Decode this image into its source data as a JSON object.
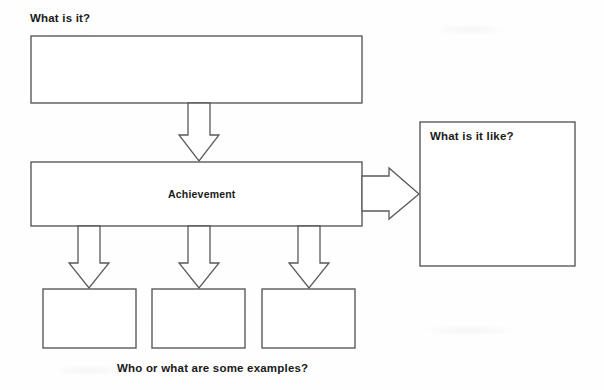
{
  "diagram": {
    "type": "concept-definition-map",
    "title_label": "What is it?",
    "concept_label": "Achievement",
    "like_label": "What is it like?",
    "examples_caption": "Who or what are some examples?",
    "stroke_color": "#5a5a5a",
    "fill_color": "#ffffff",
    "text_color": "#1a1a1a",
    "boxes": {
      "definition_box": {
        "label": "",
        "x": 31,
        "y": 36,
        "w": 331,
        "h": 67
      },
      "concept_box": {
        "label": "Achievement",
        "x": 31,
        "y": 162,
        "w": 331,
        "h": 64
      },
      "like_box": {
        "label": "",
        "x": 420,
        "y": 122,
        "w": 155,
        "h": 144
      },
      "example_box_1": {
        "label": "",
        "x": 43,
        "y": 289,
        "w": 93,
        "h": 59
      },
      "example_box_2": {
        "label": "",
        "x": 152,
        "y": 289,
        "w": 93,
        "h": 59
      },
      "example_box_3": {
        "label": "",
        "x": 262,
        "y": 289,
        "w": 93,
        "h": 59
      }
    },
    "arrows": {
      "definition_to_concept": {
        "direction": "down"
      },
      "concept_to_like": {
        "direction": "right"
      },
      "concept_to_example_1": {
        "direction": "down"
      },
      "concept_to_example_2": {
        "direction": "down"
      },
      "concept_to_example_3": {
        "direction": "down"
      }
    }
  }
}
